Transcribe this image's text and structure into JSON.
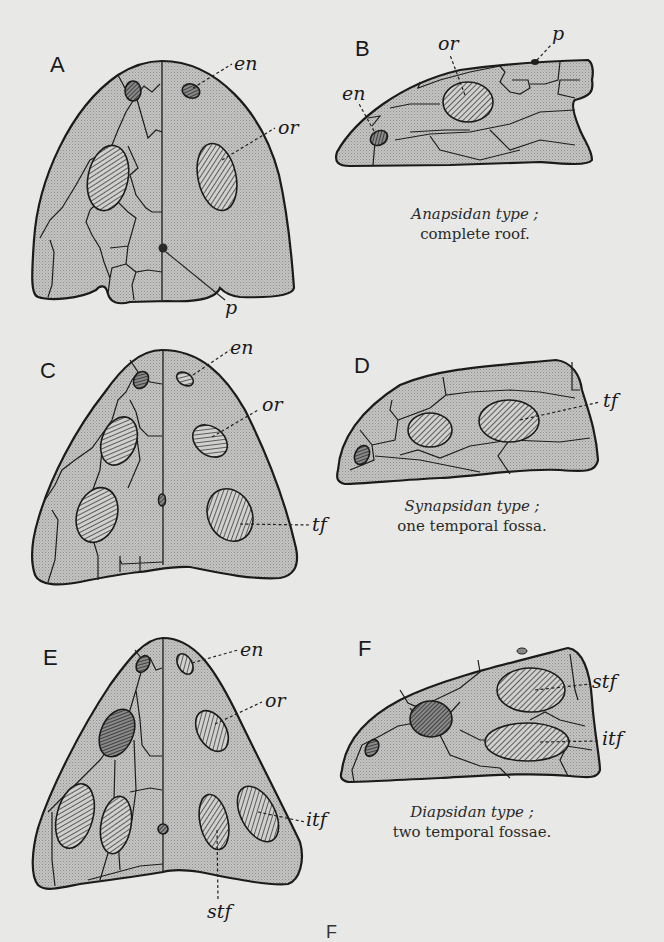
{
  "figure": {
    "panels": [
      {
        "id": "A",
        "view": "dorsal",
        "labels": [
          "en",
          "or",
          "p"
        ]
      },
      {
        "id": "B",
        "view": "lateral",
        "labels": [
          "en",
          "or",
          "p"
        ],
        "caption_italic": "Anapsidan type ;",
        "caption_roman": "complete roof."
      },
      {
        "id": "C",
        "view": "dorsal",
        "labels": [
          "en",
          "or",
          "tf"
        ]
      },
      {
        "id": "D",
        "view": "lateral",
        "labels": [
          "tf"
        ],
        "caption_italic": "Synapsidan type ;",
        "caption_roman": "one temporal fossa."
      },
      {
        "id": "E",
        "view": "dorsal",
        "labels": [
          "en",
          "or",
          "itf",
          "stf"
        ]
      },
      {
        "id": "F",
        "view": "lateral",
        "labels": [
          "stf",
          "itf"
        ],
        "caption_italic": "Diapsidan type ;",
        "caption_roman": "two temporal fossae."
      }
    ],
    "footer_fragment": "F"
  },
  "colors": {
    "background": "#e8e8e6",
    "fill": "#bcbcbc",
    "outline": "#1b1b1b"
  }
}
